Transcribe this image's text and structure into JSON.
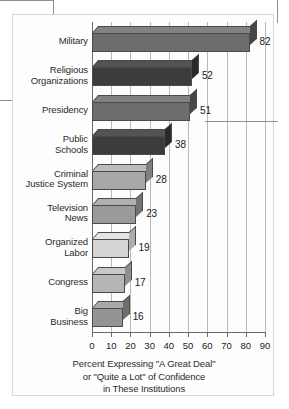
{
  "chart_data": {
    "type": "bar",
    "orientation": "horizontal",
    "title": "",
    "categories": [
      "Military",
      "Religious Organizations",
      "Presidency",
      "Public Schools",
      "Criminal Justice System",
      "Television News",
      "Organized Labor",
      "Congress",
      "Big Business"
    ],
    "category_lines": [
      [
        "Military"
      ],
      [
        "Religious",
        "Organizations"
      ],
      [
        "Presidency"
      ],
      [
        "Public",
        "Schools"
      ],
      [
        "Criminal",
        "Justice System"
      ],
      [
        "Television",
        "News"
      ],
      [
        "Organized",
        "Labor"
      ],
      [
        "Congress"
      ],
      [
        "Big",
        "Business"
      ]
    ],
    "values": [
      82,
      52,
      51,
      38,
      28,
      23,
      19,
      17,
      16
    ],
    "bar_colors": [
      "#6d6d6d",
      "#3c3c3c",
      "#6d6d6d",
      "#3c3c3c",
      "#a8a8a8",
      "#9a9a9a",
      "#d4d4d4",
      "#b5b5b5",
      "#949494"
    ],
    "bar_top_colors": [
      "#828282",
      "#535353",
      "#828282",
      "#535353",
      "#bcbcbc",
      "#b0b0b0",
      "#e4e4e4",
      "#c9c9c9",
      "#a9a9a9"
    ],
    "bar_side_colors": [
      "#474747",
      "#2a2a2a",
      "#474747",
      "#2a2a2a",
      "#7f7f7f",
      "#737373",
      "#aeaeae",
      "#8f8f8f",
      "#6e6e6e"
    ],
    "xlabel_lines": [
      "Percent Expressing \"A Great Deal\"",
      "or \"Quite a Lot\" of Confidence",
      "in These Institutions"
    ],
    "ylabel": "",
    "xlim": [
      0,
      90
    ],
    "xticks": [
      0,
      10,
      20,
      30,
      40,
      50,
      60,
      70,
      80,
      90
    ],
    "xtick_labels": [
      "0",
      "10",
      "20",
      "30",
      "40",
      "50",
      "60",
      "70",
      "80",
      "90"
    ],
    "grid": true,
    "grid_axis": "x",
    "legend": null,
    "value_labels_shown": true
  }
}
